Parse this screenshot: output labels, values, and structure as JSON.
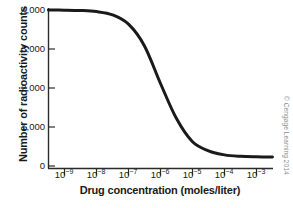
{
  "chart_data": {
    "type": "line",
    "title": "",
    "xlabel": "Drug concentration (moles/liter)",
    "ylabel": "Number of radioactivity counts",
    "xscale": "log",
    "xlim": [
      3.16e-10,
      0.00316
    ],
    "ylim": [
      0,
      4000
    ],
    "grid": false,
    "legend": null,
    "xtick_labels": [
      "10−9",
      "10−8",
      "10−7",
      "10−6",
      "10−5",
      "10−4",
      "10−3"
    ],
    "xtick_bases": [
      "10",
      "10",
      "10",
      "10",
      "10",
      "10",
      "10"
    ],
    "xtick_exponents": [
      "−9",
      "−8",
      "−7",
      "−6",
      "−5",
      "−4",
      "−3"
    ],
    "xtick_values": [
      1e-09,
      1e-08,
      1e-07,
      1e-06,
      1e-05,
      0.0001,
      0.001
    ],
    "ytick_labels": [
      "4,000",
      "3,000",
      "2,000",
      "1,000",
      "0"
    ],
    "ytick_values": [
      4000,
      3000,
      2000,
      1000,
      0
    ],
    "series": [
      {
        "name": "Bound radioactivity",
        "color": "#1a1a1a",
        "line_width": 3,
        "top_plateau": 4000,
        "bottom_plateau": 230,
        "ic50": 1.1e-06,
        "hill_slope": 1.0,
        "x": [
          3.16e-10,
          1e-09,
          3.16e-09,
          1e-08,
          3.16e-08,
          1e-07,
          3.16e-07,
          1e-06,
          3.16e-06,
          1e-05,
          3.16e-05,
          0.0001,
          0.000316,
          0.001,
          0.00316
        ],
        "y": [
          3999,
          3996,
          3987,
          3959,
          3875,
          3636,
          3079,
          2115,
          1216,
          621,
          390,
          285,
          248,
          236,
          232
        ]
      }
    ]
  },
  "annotations": {
    "copyright": "© Cengage Learning 2014"
  }
}
